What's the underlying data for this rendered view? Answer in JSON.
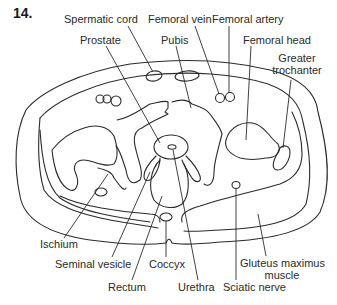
{
  "figure": {
    "number": "14."
  },
  "labels": {
    "spermatic_cord": "Spermatic cord",
    "femoral_vein": "Femoral vein",
    "femoral_artery": "Femoral artery",
    "prostate": "Prostate",
    "pubis": "Pubis",
    "femoral_head": "Femoral head",
    "greater_trochanter_1": "Greater",
    "greater_trochanter_2": "trochanter",
    "ischium": "Ischium",
    "seminal_vesicle": "Seminal vesicle",
    "coccyx": "Coccyx",
    "gluteus_maximus_1": "Gluteus maximus",
    "gluteus_maximus_2": "muscle",
    "rectum": "Rectum",
    "urethra": "Urethra",
    "sciatic_nerve": "Sciatic nerve"
  },
  "colors": {
    "line": "#2b2b2b",
    "text": "#2a2a2a",
    "background": "#ffffff"
  }
}
